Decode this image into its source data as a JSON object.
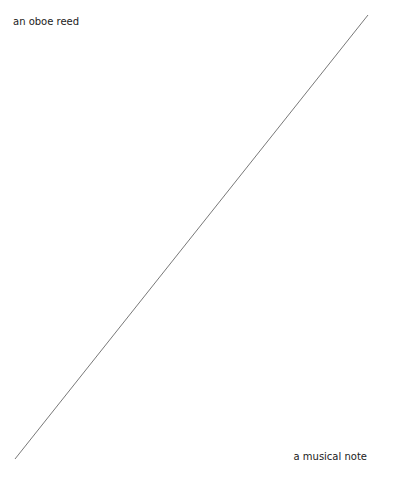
{
  "labels": {
    "top_left": "an oboe reed",
    "bottom_right": "a musical note"
  },
  "line": {
    "x1": 368,
    "y1": 15,
    "x2": 15,
    "y2": 459,
    "color": "#555555"
  }
}
